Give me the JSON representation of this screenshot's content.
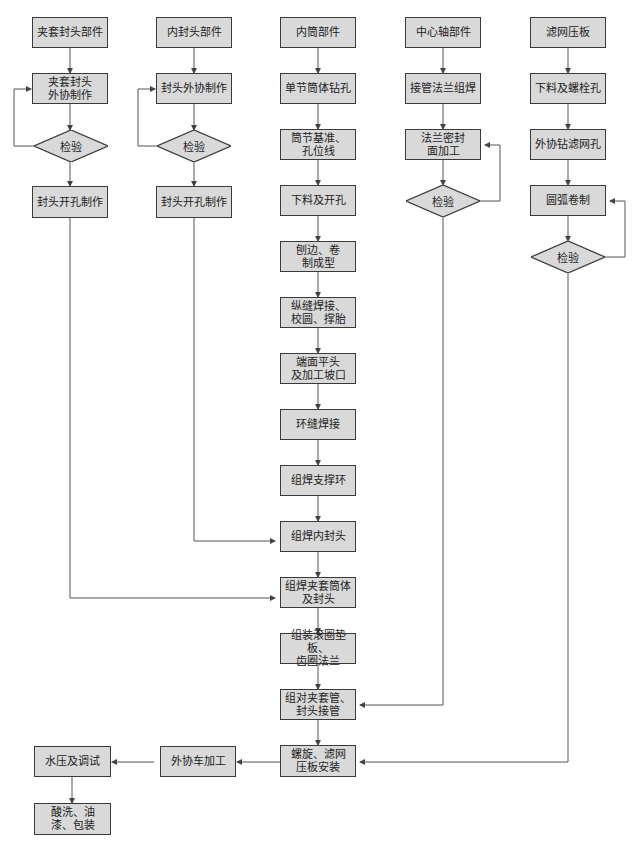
{
  "diagram": {
    "columns": [
      {
        "header": "夹套封头部件",
        "steps": [
          "夹套封头\n外协制作",
          "检验",
          "封头开孔制作"
        ]
      },
      {
        "header": "内封头部件",
        "steps": [
          "封头外协制作",
          "检验",
          "封头开孔制作"
        ]
      },
      {
        "header": "内筒部件",
        "steps": [
          "单节筒体钻孔",
          "筒节基准、\n孔位线",
          "下料及开孔",
          "刨边、卷\n制成型",
          "纵缝焊接、\n校圆、撑胎",
          "端面平头\n及加工坡口",
          "环缝焊接",
          "组焊支撑环",
          "组焊内封头",
          "组焊夹套筒体\n及封头",
          "组装滚圈垫板、\n齿圈法兰",
          "组对夹套管、\n封头接管",
          "螺旋、滤网\n压板安装"
        ]
      },
      {
        "header": "中心轴部件",
        "steps": [
          "接管法兰组焊",
          "法兰密封\n面加工",
          "检验"
        ]
      },
      {
        "header": "滤网压板",
        "steps": [
          "下料及螺栓孔",
          "外协钻滤网孔",
          "圆弧卷制",
          "检验"
        ]
      }
    ],
    "final": [
      "外协车加工",
      "水压及调试",
      "酸洗、油\n漆、包装"
    ]
  }
}
